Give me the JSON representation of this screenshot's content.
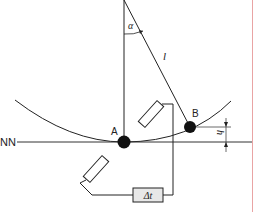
{
  "diagram": {
    "labels": {
      "reference_line": "NN",
      "point_a": "A",
      "point_b": "B",
      "angle": "α",
      "length": "l",
      "height": "h",
      "timer": "Δt"
    },
    "colors": {
      "line": "#222222",
      "timer_fill": "#e6e6e6",
      "border_right": "#e8a0a0"
    }
  }
}
